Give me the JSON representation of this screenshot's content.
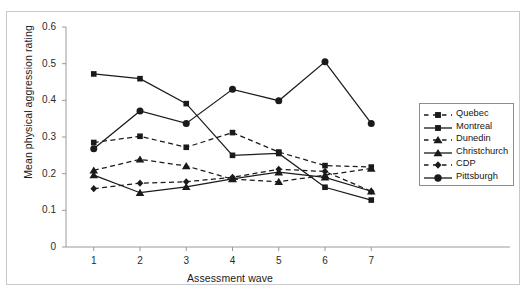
{
  "figure": {
    "top_fragment": "",
    "background": "#ffffff",
    "frame_color": "#c9c9c9",
    "ink_color": "#1a1a1a"
  },
  "chart_data": {
    "type": "line",
    "title": "",
    "xlabel": "Assessment wave",
    "ylabel": "Mean physical aggression rating",
    "x": [
      1,
      2,
      3,
      4,
      5,
      6,
      7
    ],
    "xtick_labels": [
      "1",
      "2",
      "3",
      "4",
      "5",
      "6",
      "7"
    ],
    "ytick_labels": [
      "0",
      "0.1",
      "0.2",
      "0.3",
      "0.4",
      "0.5",
      "0.6"
    ],
    "ytick_values": [
      0,
      0.1,
      0.2,
      0.3,
      0.4,
      0.5,
      0.6
    ],
    "xlim": [
      0.4,
      7.6
    ],
    "ylim": [
      0,
      0.6
    ],
    "grid": false,
    "legend_position": "right",
    "series": [
      {
        "name": "Quebec",
        "marker": "square",
        "linestyle": "dashed",
        "color": "#1a1a1a",
        "values": [
          0.285,
          0.302,
          0.272,
          0.312,
          0.259,
          0.222,
          0.218
        ]
      },
      {
        "name": "Montreal",
        "marker": "square",
        "linestyle": "solid",
        "color": "#1a1a1a",
        "values": [
          0.472,
          0.459,
          0.391,
          0.25,
          0.255,
          0.163,
          0.128
        ]
      },
      {
        "name": "Dunedin",
        "marker": "triangle",
        "linestyle": "dashed",
        "color": "#1a1a1a",
        "values": [
          0.209,
          0.239,
          0.221,
          0.185,
          0.178,
          0.196,
          0.214
        ]
      },
      {
        "name": "Christchurch",
        "marker": "triangle",
        "linestyle": "solid",
        "color": "#1a1a1a",
        "values": [
          0.196,
          0.148,
          0.164,
          0.186,
          0.204,
          0.19,
          0.152
        ]
      },
      {
        "name": "CDP",
        "marker": "diamond",
        "linestyle": "dashed",
        "color": "#1a1a1a",
        "values": [
          0.159,
          0.174,
          0.178,
          0.19,
          0.212,
          0.206,
          0.152
        ]
      },
      {
        "name": "Pittsburgh",
        "marker": "circle",
        "linestyle": "solid",
        "color": "#1a1a1a",
        "values": [
          0.268,
          0.371,
          0.337,
          0.43,
          0.399,
          0.505,
          0.337
        ]
      }
    ]
  }
}
